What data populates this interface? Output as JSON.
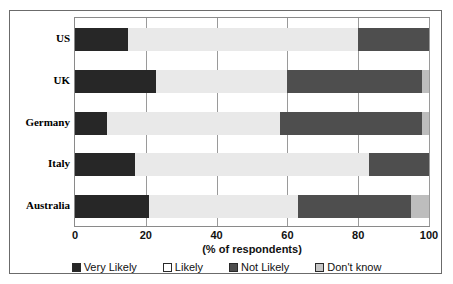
{
  "chart_data": {
    "type": "bar",
    "orientation": "horizontal",
    "stacked": true,
    "percent_stacked": true,
    "title": "",
    "xlabel": "(% of respondents)",
    "ylabel": "",
    "xlim": [
      0,
      100
    ],
    "xticks": [
      0,
      20,
      40,
      60,
      80,
      100
    ],
    "xtick_labels": [
      "0",
      "20",
      "40",
      "60",
      "80",
      "100"
    ],
    "grid": true,
    "grid_axis": "x",
    "legend_position": "bottom",
    "categories": [
      "US",
      "UK",
      "Germany",
      "Italy",
      "Australia"
    ],
    "series": [
      {
        "name": "Very Likely",
        "color": "#272727",
        "values": [
          15,
          23,
          9,
          17,
          21
        ]
      },
      {
        "name": "Likely",
        "color": "#e9e9e9",
        "values": [
          65,
          37,
          49,
          66,
          42
        ]
      },
      {
        "name": "Not Likely",
        "color": "#4e4e4e",
        "values": [
          20,
          38,
          40,
          17,
          32
        ]
      },
      {
        "name": "Don't know",
        "color": "#bdbdbd",
        "values": [
          0,
          2,
          2,
          0,
          5
        ]
      }
    ]
  },
  "axis": {
    "x_title": "(% of respondents)",
    "ticks": [
      "0",
      "20",
      "40",
      "60",
      "80",
      "100"
    ]
  },
  "categories": [
    {
      "label": "US"
    },
    {
      "label": "UK"
    },
    {
      "label": "Germany"
    },
    {
      "label": "Italy"
    },
    {
      "label": "Australia"
    }
  ],
  "legend": {
    "items": [
      {
        "label": "Very Likely",
        "swatch": "very"
      },
      {
        "label": "Likely",
        "swatch": "likely"
      },
      {
        "label": "Not Likely",
        "swatch": "notlikely"
      },
      {
        "label": "Don't know",
        "swatch": "dontknow"
      }
    ]
  },
  "colors": {
    "very_likely": "#272727",
    "likely": "#e9e9e9",
    "not_likely": "#4e4e4e",
    "dont_know": "#bdbdbd",
    "frame": "#6b6b6b",
    "gridline": "#9a9a9a"
  }
}
